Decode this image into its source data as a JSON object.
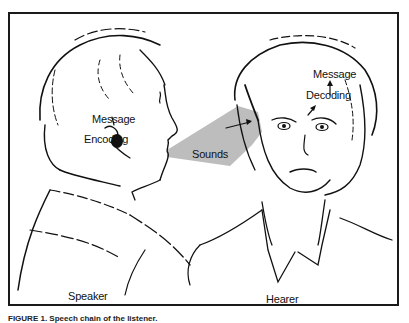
{
  "figure": {
    "labels": {
      "speaker_message": "Message",
      "encoding": "Encoding",
      "sounds": "Sounds",
      "hearer_message": "Message",
      "decoding": "Decoding",
      "speaker": "Speaker",
      "hearer": "Hearer"
    },
    "caption": "FIGURE 1. Speech chain of the listener.",
    "colors": {
      "line": "#111111",
      "sound_cone": "#bdbdbd",
      "frame": "#1a1a1a"
    }
  }
}
